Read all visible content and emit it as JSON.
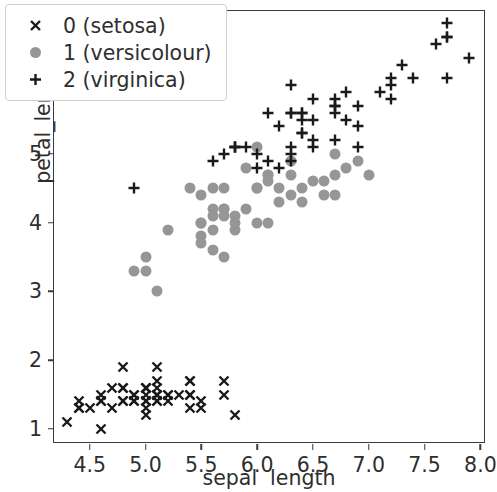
{
  "chart_data": {
    "type": "scatter",
    "title": "",
    "xlabel": "sepal  length",
    "ylabel": "petal_length",
    "xlim": [
      4.18,
      8.05
    ],
    "ylim": [
      0.78,
      7.08
    ],
    "xticks": [
      "4.5",
      "5.0",
      "5.5",
      "6.0",
      "6.5",
      "7.0",
      "7.5",
      "8.0"
    ],
    "xtick_values": [
      4.5,
      5.0,
      5.5,
      6.0,
      6.5,
      7.0,
      7.5,
      8.0
    ],
    "yticks": [
      "1",
      "2",
      "3",
      "4",
      "5",
      "6",
      "7"
    ],
    "ytick_values": [
      1,
      2,
      3,
      4,
      5,
      6,
      7
    ],
    "grid": false,
    "legend_position": "upper left",
    "series": [
      {
        "name": "0 (setosa)",
        "marker": "x",
        "color": "#1a1a1a",
        "x": [
          5.1,
          4.9,
          4.7,
          4.6,
          5.0,
          5.4,
          4.6,
          5.0,
          4.4,
          4.9,
          5.4,
          4.8,
          4.8,
          4.3,
          5.8,
          5.7,
          5.4,
          5.1,
          5.7,
          5.1,
          5.4,
          5.1,
          4.6,
          5.1,
          4.8,
          5.0,
          5.0,
          5.2,
          5.2,
          4.7,
          4.8,
          5.4,
          5.2,
          5.5,
          4.9,
          5.0,
          5.5,
          4.9,
          4.4,
          5.1,
          5.0,
          4.5,
          4.4,
          5.0,
          5.1,
          4.8,
          5.1,
          4.6,
          5.3,
          5.0
        ],
        "y": [
          1.4,
          1.4,
          1.3,
          1.5,
          1.4,
          1.7,
          1.4,
          1.5,
          1.4,
          1.5,
          1.5,
          1.6,
          1.4,
          1.1,
          1.2,
          1.5,
          1.3,
          1.4,
          1.7,
          1.5,
          1.7,
          1.5,
          1.0,
          1.7,
          1.9,
          1.6,
          1.6,
          1.5,
          1.4,
          1.6,
          1.6,
          1.5,
          1.5,
          1.4,
          1.5,
          1.2,
          1.3,
          1.4,
          1.3,
          1.5,
          1.3,
          1.3,
          1.3,
          1.6,
          1.9,
          1.4,
          1.6,
          1.4,
          1.5,
          1.4
        ]
      },
      {
        "name": "1 (versicolour)",
        "marker": "o",
        "color": "#969696",
        "x": [
          7.0,
          6.4,
          6.9,
          5.5,
          6.5,
          5.7,
          6.3,
          4.9,
          6.6,
          5.2,
          5.0,
          5.9,
          6.0,
          6.1,
          5.6,
          6.7,
          5.6,
          5.8,
          6.2,
          5.6,
          5.9,
          6.1,
          6.3,
          6.1,
          6.4,
          6.6,
          6.8,
          6.7,
          6.0,
          5.7,
          5.5,
          5.5,
          5.8,
          6.0,
          5.4,
          6.0,
          6.7,
          6.3,
          5.6,
          5.5,
          5.5,
          6.1,
          5.8,
          5.0,
          5.6,
          5.7,
          5.7,
          6.2,
          5.1,
          5.7
        ],
        "y": [
          4.7,
          4.5,
          4.9,
          4.0,
          4.6,
          4.5,
          4.7,
          3.3,
          4.6,
          3.9,
          3.5,
          4.2,
          4.0,
          4.7,
          3.6,
          4.4,
          4.5,
          4.1,
          4.5,
          3.9,
          4.8,
          4.0,
          4.9,
          4.7,
          4.3,
          4.4,
          4.8,
          5.0,
          4.5,
          3.5,
          3.8,
          3.7,
          3.9,
          5.1,
          4.5,
          4.5,
          4.7,
          4.4,
          4.1,
          4.0,
          4.4,
          4.6,
          4.0,
          3.3,
          4.2,
          4.2,
          4.2,
          4.3,
          3.0,
          4.1
        ]
      },
      {
        "name": "2 (virginica)",
        "marker": "+",
        "color": "#1a1a1a",
        "x": [
          6.3,
          5.8,
          7.1,
          6.3,
          6.5,
          7.6,
          4.9,
          7.3,
          6.7,
          7.2,
          6.5,
          6.4,
          6.8,
          5.7,
          5.8,
          6.4,
          6.5,
          7.7,
          7.7,
          6.0,
          6.9,
          5.6,
          7.7,
          6.3,
          6.7,
          7.2,
          6.2,
          6.1,
          6.4,
          7.2,
          7.4,
          7.9,
          6.4,
          6.3,
          6.1,
          7.7,
          6.3,
          6.4,
          6.0,
          6.9,
          6.7,
          6.9,
          5.8,
          6.8,
          6.7,
          6.7,
          6.3,
          6.5,
          6.2,
          5.9
        ],
        "y": [
          6.0,
          5.1,
          5.9,
          5.6,
          5.8,
          6.6,
          4.5,
          6.3,
          5.8,
          6.1,
          5.1,
          5.3,
          5.5,
          5.0,
          5.1,
          5.3,
          5.5,
          6.7,
          6.9,
          5.0,
          5.7,
          4.9,
          6.7,
          4.9,
          5.7,
          6.0,
          4.8,
          4.9,
          5.6,
          5.8,
          6.1,
          6.4,
          5.6,
          5.1,
          5.6,
          6.1,
          5.6,
          5.5,
          4.8,
          5.4,
          5.6,
          5.1,
          5.1,
          5.9,
          5.7,
          5.2,
          5.0,
          5.2,
          5.4,
          5.1
        ]
      }
    ]
  },
  "legend": {
    "items": [
      {
        "label": "0 (setosa)",
        "marker": "x",
        "color": "#1a1a1a"
      },
      {
        "label": "1 (versicolour)",
        "marker": "o",
        "color": "#969696"
      },
      {
        "label": "2 (virginica)",
        "marker": "+",
        "color": "#1a1a1a"
      }
    ]
  },
  "axes": {
    "xlabel": "sepal  length",
    "ylabel": "petal_length"
  }
}
